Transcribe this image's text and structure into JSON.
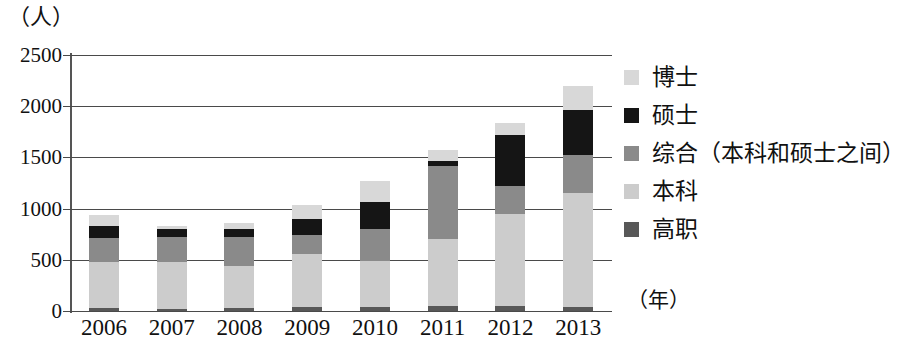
{
  "chart_data": {
    "type": "bar",
    "stacked": true,
    "title": "",
    "xlabel": "（年）",
    "ylabel": "（人）",
    "categories": [
      "2006",
      "2007",
      "2008",
      "2009",
      "2010",
      "2011",
      "2012",
      "2013"
    ],
    "ylim": [
      0,
      2500
    ],
    "yticks": [
      0,
      500,
      1000,
      1500,
      2000,
      2500
    ],
    "ytick_labels": [
      "0",
      "500",
      "1000",
      "1500",
      "2000",
      "2500"
    ],
    "grid": true,
    "legend_position": "right",
    "series": [
      {
        "name": "高职",
        "color": "#585858",
        "values": [
          30,
          20,
          30,
          40,
          40,
          50,
          50,
          40
        ]
      },
      {
        "name": "本科",
        "color": "#cccccc",
        "values": [
          450,
          460,
          410,
          520,
          450,
          650,
          900,
          1110
        ]
      },
      {
        "name": "综合（本科和硕士之间）",
        "color": "#8a8a8a",
        "values": [
          230,
          240,
          280,
          180,
          310,
          720,
          270,
          370
        ]
      },
      {
        "name": "硕士",
        "color": "#151515",
        "values": [
          120,
          80,
          80,
          160,
          260,
          50,
          500,
          440
        ]
      },
      {
        "name": "博士",
        "color": "#d8d8d8",
        "values": [
          110,
          30,
          60,
          140,
          210,
          100,
          120,
          240
        ]
      }
    ],
    "totals": [
      840,
      830,
      860,
      1040,
      1270,
      1570,
      1840,
      2200
    ],
    "stack_order_bottom_to_top": [
      "高职",
      "本科",
      "综合（本科和硕士之间）",
      "硕士",
      "博士"
    ]
  },
  "legend": {
    "items": [
      {
        "label": "博士",
        "color": "#d8d8d8"
      },
      {
        "label": "硕士",
        "color": "#151515"
      },
      {
        "label": "综合（本科和硕士之间）",
        "color": "#8a8a8a"
      },
      {
        "label": "本科",
        "color": "#cccccc"
      },
      {
        "label": "高职",
        "color": "#585858"
      }
    ]
  },
  "axes": {
    "y_unit": "（人）",
    "x_unit": "（年）"
  }
}
